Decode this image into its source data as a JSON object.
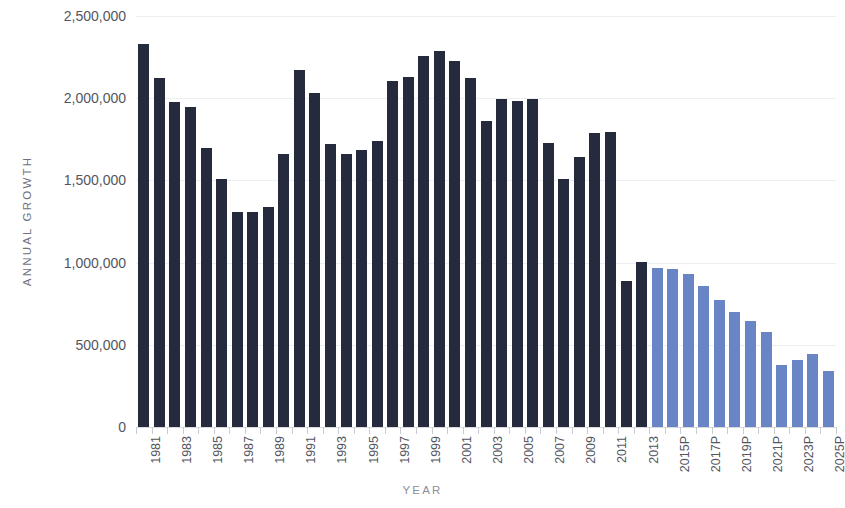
{
  "chart_data": {
    "type": "bar",
    "title": "",
    "xlabel": "YEAR",
    "ylabel": "ANNUAL GROWTH",
    "ylim": [
      0,
      2500000
    ],
    "ytick_values": [
      0,
      500000,
      1000000,
      1500000,
      2000000,
      2500000
    ],
    "ytick_labels": [
      "0",
      "500,000",
      "1,000,000",
      "1,500,000",
      "2,000,000",
      "2,500,000"
    ],
    "grid": true,
    "legend": "none",
    "colors": {
      "actual": "#262a3d",
      "projected": "#6a85c6",
      "gridline": "#eceef1",
      "axis_text": "#53565f",
      "axis_title": "#6e727f",
      "background": "#ffffff"
    },
    "categories": [
      "1981",
      "1982",
      "1983",
      "1984",
      "1985",
      "1986",
      "1987",
      "1988",
      "1989",
      "1990",
      "1991",
      "1992",
      "1993",
      "1994",
      "1995",
      "1996",
      "1997",
      "1998",
      "1999",
      "2000",
      "2001",
      "2002",
      "2003",
      "2004",
      "2005",
      "2006",
      "2007",
      "2008",
      "2009",
      "2010",
      "2011",
      "2012",
      "2013",
      "2014P",
      "2015P",
      "2016P",
      "2017P",
      "2018P",
      "2019P",
      "2020P",
      "2021P",
      "2022P",
      "2023P",
      "2024P",
      "2025P"
    ],
    "tick_label_indices": [
      0,
      2,
      4,
      6,
      8,
      10,
      12,
      14,
      16,
      18,
      20,
      22,
      24,
      26,
      28,
      30,
      32,
      34,
      36,
      38,
      40,
      42,
      44
    ],
    "tick_labels_shown": [
      "1981",
      "1983",
      "1985",
      "1987",
      "1989",
      "1991",
      "1993",
      "1995",
      "1997",
      "1999",
      "2001",
      "2003",
      "2005",
      "2007",
      "2009",
      "2011",
      "2013",
      "2015P",
      "2017P",
      "2019P",
      "2021P",
      "2023P",
      "2025P"
    ],
    "values": [
      2330000,
      2120000,
      1980000,
      1945000,
      1700000,
      1510000,
      1310000,
      1305000,
      1340000,
      1660000,
      2170000,
      2030000,
      1720000,
      1660000,
      1685000,
      1740000,
      2105000,
      2130000,
      2255000,
      2290000,
      2225000,
      2120000,
      1860000,
      1995000,
      1985000,
      1995000,
      1730000,
      1510000,
      1640000,
      1790000,
      1795000,
      890000,
      1005000,
      970000,
      960000,
      930000,
      860000,
      770000,
      700000,
      645000,
      580000,
      375000,
      405000,
      445000,
      340000
    ],
    "series": [
      {
        "name": "Actual",
        "kind": "actual",
        "start_index": 0,
        "end_index": 32,
        "color": "#262a3d"
      },
      {
        "name": "Projected",
        "kind": "projected",
        "start_index": 33,
        "end_index": 44,
        "color": "#6a85c6"
      }
    ]
  }
}
